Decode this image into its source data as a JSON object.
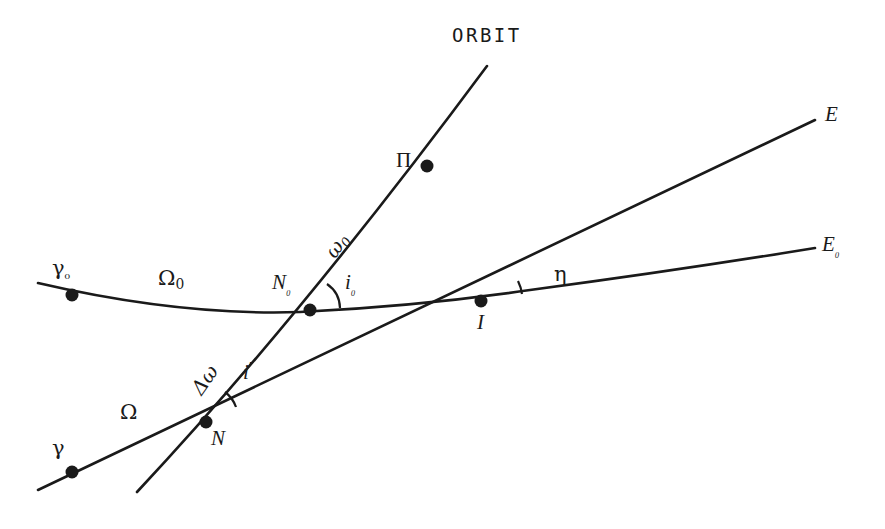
{
  "figure": {
    "kind": "orbital-elements-geometry-diagram",
    "background_color": "#ffffff",
    "ink_color": "#1a1a1a",
    "width": 885,
    "height": 529
  },
  "labels": {
    "orbit": "ORBIT",
    "perigee": "Π",
    "omega_zero": "ω",
    "omega_zero_sub": "0",
    "node_zero": "N",
    "node_zero_sub": "₀",
    "inclination_zero": "i",
    "inclination_zero_sub": "₀",
    "intersection": "I",
    "eta": "η",
    "equator_new": "E",
    "equator_zero": "E",
    "equator_zero_sub": "₀",
    "gamma_zero": "γ",
    "gamma_zero_sub": "₀",
    "raan_zero": "Ω",
    "raan_zero_sub": "0",
    "gamma": "γ",
    "raan": "Ω",
    "delta_omega": "Δω",
    "inclination": "i",
    "node": "N"
  },
  "curves": {
    "equator_zero": {
      "name": "E0-reference-equator",
      "path": "M 38 283 Q 180 316 300 312 Q 420 306 530 290 Q 680 270 815 248"
    },
    "equator_new": {
      "name": "E-new-equator",
      "path": "M 38 490 L 815 120"
    },
    "orbit": {
      "name": "satellite-orbit-line",
      "path": "M 137 492 Q 300 318 487 66"
    }
  },
  "points": [
    {
      "name": "gamma-zero-point",
      "x": 72,
      "y": 295
    },
    {
      "name": "node-zero-point",
      "x": 310,
      "y": 310
    },
    {
      "name": "intersection-point",
      "x": 481,
      "y": 301
    },
    {
      "name": "perigee-point",
      "x": 427,
      "y": 166
    },
    {
      "name": "node-point",
      "x": 206,
      "y": 422
    },
    {
      "name": "gamma-point",
      "x": 72,
      "y": 472
    }
  ],
  "angle_arcs": [
    {
      "name": "inclination-zero-arc",
      "cx": 310,
      "cy": 310,
      "r": 30
    },
    {
      "name": "eta-arc",
      "cx": 481,
      "cy": 301,
      "r": 42
    },
    {
      "name": "inclination-arc",
      "cx": 206,
      "cy": 422,
      "r": 32
    }
  ]
}
